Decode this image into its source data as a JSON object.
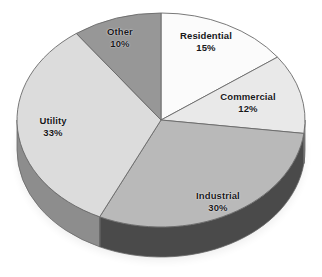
{
  "chart_data": {
    "type": "pie",
    "title": "",
    "subtitle": "",
    "xlabel": "",
    "ylabel": "",
    "legend_position": "none",
    "grid": false,
    "three_d": true,
    "start_angle_deg": 0,
    "direction": "clockwise",
    "units": "percent",
    "total": 100,
    "categories": [
      "Residential",
      "Commercial",
      "Industrial",
      "Utility",
      "Other"
    ],
    "values": [
      15,
      12,
      30,
      33,
      10
    ],
    "labels": [
      "15%",
      "12%",
      "30%",
      "33%",
      "10%"
    ],
    "slices": [
      {
        "name": "Residential",
        "value": 15,
        "value_label": "15%",
        "color": "#fbfbfb",
        "side_color": "#cfcfcf",
        "label_x": 206,
        "label_y": 36
      },
      {
        "name": "Commercial",
        "value": 12,
        "value_label": "12%",
        "color": "#e9e9e9",
        "side_color": "#bdbdbd",
        "label_x": 248,
        "label_y": 97
      },
      {
        "name": "Industrial",
        "value": 30,
        "value_label": "30%",
        "color": "#b9b9b9",
        "side_color": "#4a4a4a",
        "label_x": 218,
        "label_y": 196
      },
      {
        "name": "Utility",
        "value": 33,
        "value_label": "33%",
        "color": "#dcdcdc",
        "side_color": "#8d8d8d",
        "label_x": 53,
        "label_y": 121
      },
      {
        "name": "Other",
        "value": 10,
        "value_label": "10%",
        "color": "#979797",
        "side_color": "#6f6f6f",
        "label_x": 120,
        "label_y": 32
      }
    ],
    "geometry": {
      "center_x": 161,
      "center_y": 120,
      "radius_x": 144,
      "radius_y": 107,
      "depth": 30
    },
    "style": {
      "background": "#ffffff",
      "outline_color": "#6a6a6a",
      "label_color": "#17171a"
    }
  }
}
